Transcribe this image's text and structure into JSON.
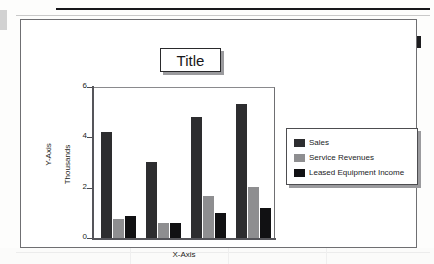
{
  "document": {
    "kind": "scanned-chart-page",
    "page_background": "#fdfdfc",
    "rule_color": "#17171a"
  },
  "chart_frame": {
    "border_color": "#6f6f72",
    "background": "#ffffff"
  },
  "title_box": {
    "text": "Title",
    "border_color": "#2a2a2c",
    "shadow_color": "#9b9b9e"
  },
  "legend": {
    "position": "right",
    "border_color": "#4d4d50",
    "shadow_color": "#9b9b9e",
    "entries": [
      {
        "label": "Sales",
        "color": "#2d2d2f",
        "swatch_icon": "legend-swatch-icon"
      },
      {
        "label": "Service Revenues",
        "color": "#8e8e90",
        "swatch_icon": "legend-swatch-icon"
      },
      {
        "label": "Leased Equipment Income",
        "color": "#111113",
        "swatch_icon": "legend-swatch-icon"
      }
    ]
  },
  "axes": {
    "y_caption": "Y-Axis",
    "y_units_caption": "Thousands",
    "x_caption": "X-Axis",
    "y_tick_labels": [
      "6",
      "4",
      "2",
      "0"
    ]
  },
  "chart_data": {
    "type": "bar",
    "title": "Title",
    "xlabel": "X-Axis",
    "ylabel": "Y-Axis",
    "y_units": "Thousands",
    "ylim": [
      0,
      6
    ],
    "yticks": [
      0,
      2,
      4,
      6
    ],
    "grid": false,
    "legend_position": "right",
    "categories": [
      "",
      "",
      "",
      ""
    ],
    "series": [
      {
        "name": "Sales",
        "color": "#2d2d2f",
        "values": [
          4.25,
          3.05,
          4.85,
          5.35
        ]
      },
      {
        "name": "Service Revenues",
        "color": "#8e8e90",
        "values": [
          0.75,
          0.6,
          1.7,
          2.05
        ]
      },
      {
        "name": "Leased Equipment Income",
        "color": "#111113",
        "values": [
          0.9,
          0.62,
          1.0,
          1.2
        ]
      }
    ]
  }
}
